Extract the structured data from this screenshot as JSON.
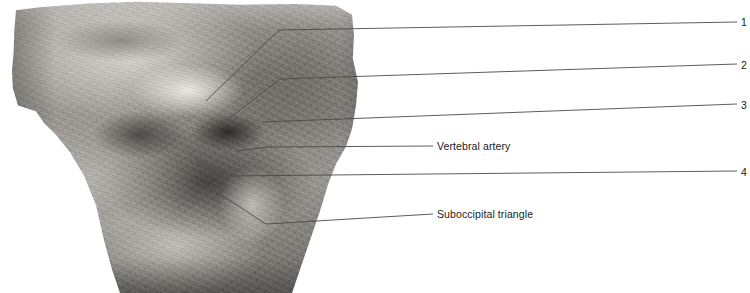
{
  "figure": {
    "kind": "anatomical-dissection-photograph",
    "region": "posterior neck / suboccipital region",
    "background_color": "#ffffff",
    "leader_line_color": "#4a4a4a",
    "text_color": "#1b1b1b"
  },
  "numbered_labels": [
    {
      "id": "1",
      "text": "1",
      "x": 741,
      "y": 22
    },
    {
      "id": "2",
      "text": "2",
      "x": 741,
      "y": 65
    },
    {
      "id": "3",
      "text": "3",
      "x": 741,
      "y": 105
    },
    {
      "id": "4",
      "text": "4",
      "x": 741,
      "y": 172
    }
  ],
  "text_labels": [
    {
      "id": "vertebral-artery",
      "text": "Vertebral artery",
      "x": 437,
      "y": 146
    },
    {
      "id": "suboccipital-triangle",
      "text": "Suboccipital triangle",
      "x": 437,
      "y": 214
    }
  ],
  "leaders": [
    {
      "id": "leader-1",
      "target_label": "1",
      "points": "206,101 279,30 737,22"
    },
    {
      "id": "leader-2",
      "target_label": "2",
      "points": "213,131 280,79 737,64"
    },
    {
      "id": "leader-3",
      "target_label": "3",
      "points": "262,122 737,104"
    },
    {
      "id": "leader-vertebral-artery",
      "target_label": "Vertebral artery",
      "points": "236,151 268,147 433,146"
    },
    {
      "id": "leader-4",
      "target_label": "4",
      "points": "197,161 229,176 737,171"
    },
    {
      "id": "leader-suboccipital-triangle",
      "target_label": "Suboccipital triangle",
      "points": "201,182 266,224 433,214"
    }
  ]
}
